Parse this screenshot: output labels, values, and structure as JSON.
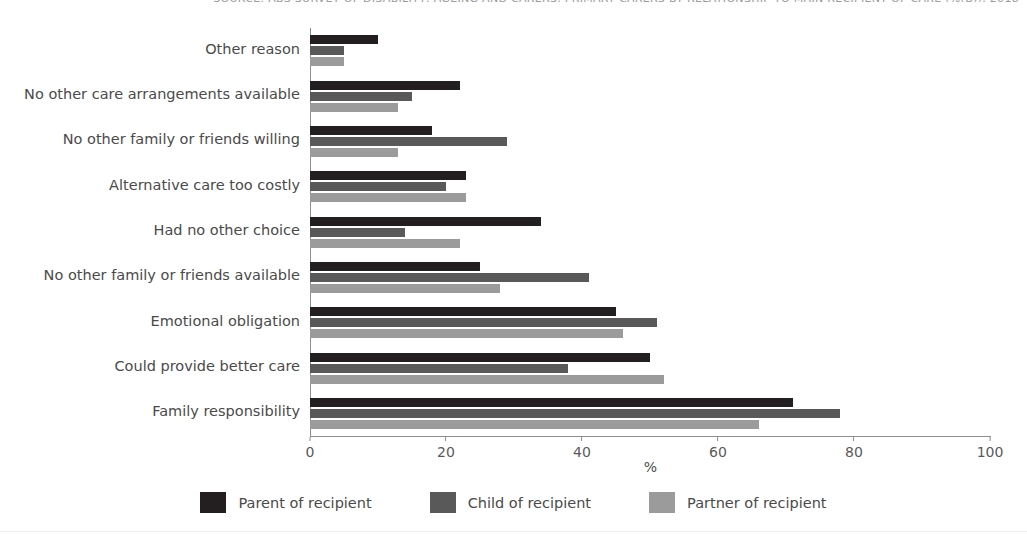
{
  "source_title": "SOURCE: ABS SURVEY OF DISABILITY, AGEING AND CARERS, PRIMARY CARERS BY RELATIONSHIP TO MAIN RECIPIENT OF CARE (%(B)), 2018",
  "chart_data": {
    "type": "bar",
    "orientation": "horizontal",
    "title": "",
    "xlabel": "%",
    "ylabel": "",
    "xlim": [
      0,
      100
    ],
    "xticks": [
      0,
      20,
      40,
      60,
      80,
      100
    ],
    "grid": false,
    "legend_position": "bottom-center",
    "categories": [
      "Other reason",
      "No other care arrangements available",
      "No other family or friends willing",
      "Alternative care too costly",
      "Had no other choice",
      "No other family or friends available",
      "Emotional obligation",
      "Could provide better care",
      "Family responsibility"
    ],
    "series": [
      {
        "name": "Parent of recipient",
        "color": "#231f20",
        "values": [
          10,
          22,
          18,
          23,
          34,
          25,
          45,
          50,
          71
        ]
      },
      {
        "name": "Child of recipient",
        "color": "#595959",
        "values": [
          5,
          15,
          29,
          20,
          14,
          41,
          51,
          38,
          78
        ]
      },
      {
        "name": "Partner of recipient",
        "color": "#9b9b9b",
        "values": [
          5,
          13,
          13,
          23,
          22,
          28,
          46,
          52,
          66
        ]
      }
    ]
  }
}
